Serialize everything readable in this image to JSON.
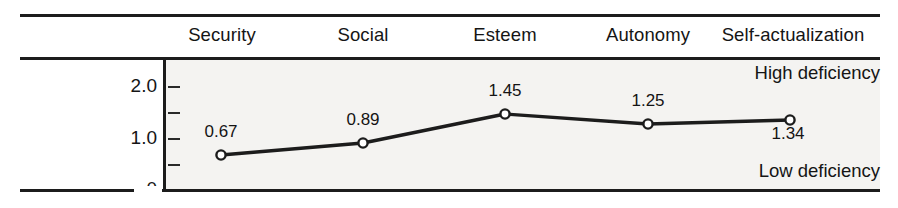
{
  "chart_data": {
    "type": "line",
    "title": "",
    "subtitle": "",
    "xlabel": "",
    "ylabel": "",
    "categories": [
      "Security",
      "Social",
      "Esteem",
      "Autonomy",
      "Self-actualization"
    ],
    "values": [
      0.67,
      0.89,
      1.45,
      1.25,
      1.34
    ],
    "point_labels": [
      "0.67",
      "0.89",
      "1.45",
      "1.25",
      "1.34"
    ],
    "series": [
      {
        "name": "Need deficiency",
        "values": [
          0.67,
          0.89,
          1.45,
          1.25,
          1.34
        ]
      }
    ],
    "ylim": [
      0,
      2.25
    ],
    "yticks": [
      0,
      0.5,
      1.0,
      1.5,
      2.0
    ],
    "ytick_labels": [
      "0",
      "",
      "1.0",
      "",
      "2.0"
    ],
    "grid": false,
    "legend": "none",
    "annotations": [
      {
        "text": "High deficiency",
        "position": "top-right"
      },
      {
        "text": "Low deficiency",
        "position": "bottom-right"
      }
    ],
    "marker": "open-circle",
    "line_color": "#1c1c1c",
    "marker_fill": "#ffffff",
    "plot_background": "#f4f3f1"
  },
  "columns": [
    {
      "label": "Security",
      "center_x": 222
    },
    {
      "label": "Social",
      "center_x": 363
    },
    {
      "label": "Esteem",
      "center_x": 505
    },
    {
      "label": "Autonomy",
      "center_x": 648
    },
    {
      "label": "Self-actualization",
      "center_x": 793
    }
  ],
  "y_axis": {
    "ticks": [
      {
        "label": "2.0",
        "value": 2.0,
        "y": 86,
        "major": true
      },
      {
        "label": "",
        "value": 1.5,
        "y": 112,
        "major": false
      },
      {
        "label": "1.0",
        "value": 1.0,
        "y": 138,
        "major": true
      },
      {
        "label": "",
        "value": 0.5,
        "y": 164,
        "major": false
      },
      {
        "label": "0",
        "value": 0.0,
        "y": 190,
        "major": true
      }
    ]
  },
  "points": [
    {
      "label": "0.67",
      "cx": 221,
      "cy": 155,
      "lx": 221,
      "ly": 131,
      "value": 0.67
    },
    {
      "label": "0.89",
      "cx": 363,
      "cy": 143,
      "lx": 363,
      "ly": 119,
      "value": 0.89
    },
    {
      "label": "1.45",
      "cx": 505,
      "cy": 114,
      "lx": 505,
      "ly": 90,
      "value": 1.45
    },
    {
      "label": "1.25",
      "cx": 648,
      "cy": 124,
      "lx": 648,
      "ly": 100,
      "value": 1.25
    },
    {
      "label": "1.34",
      "cx": 790,
      "cy": 120,
      "lx": 788,
      "ly": 126,
      "value": 1.34
    }
  ],
  "annotations": {
    "high": "High deficiency",
    "low": "Low deficiency"
  }
}
